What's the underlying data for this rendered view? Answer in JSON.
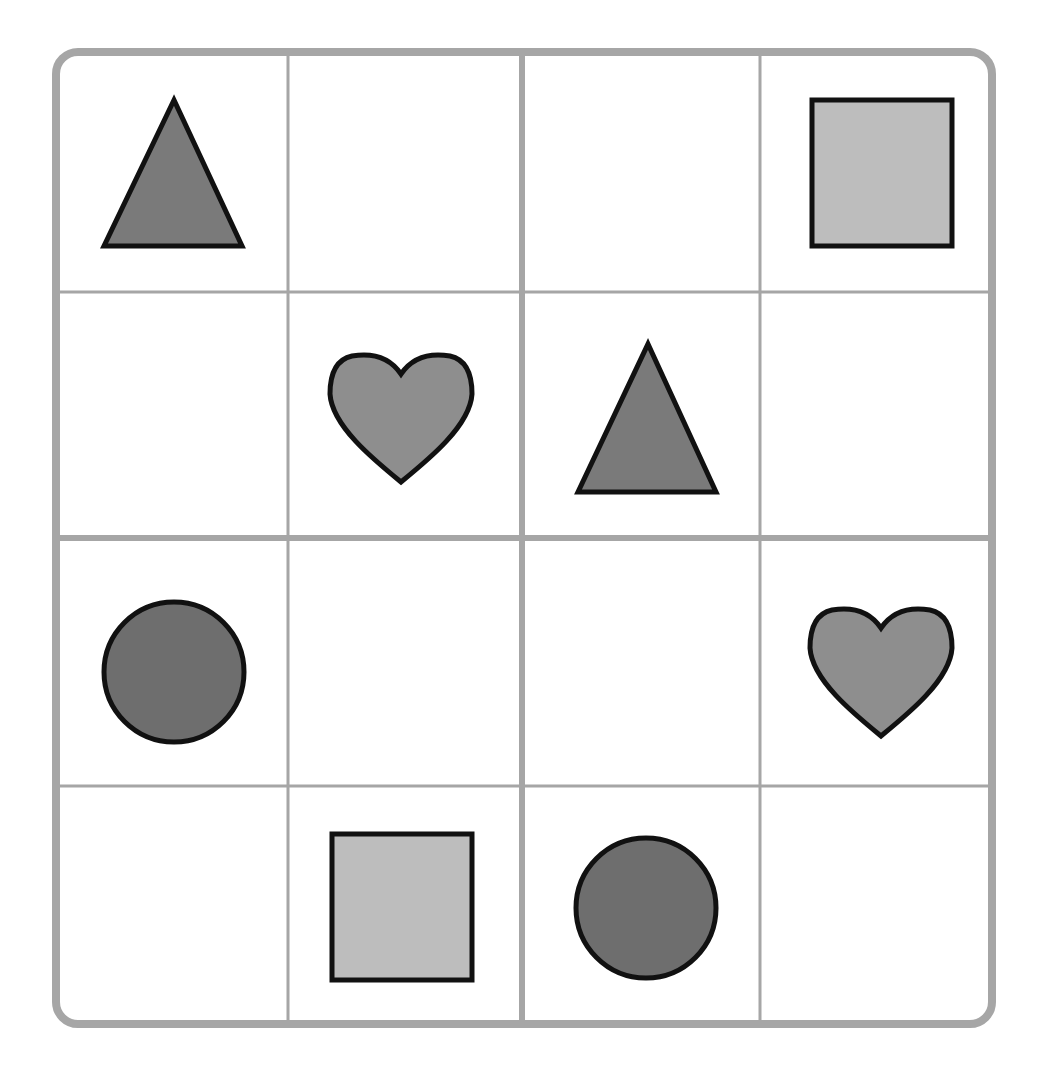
{
  "puzzle": {
    "type": "shape-sudoku-4x4",
    "rows": 4,
    "cols": 4,
    "grid": [
      [
        "triangle",
        "",
        "",
        "square"
      ],
      [
        "",
        "heart",
        "triangle",
        ""
      ],
      [
        "circle",
        "",
        "",
        "heart"
      ],
      [
        "",
        "square",
        "circle",
        ""
      ]
    ]
  },
  "colors": {
    "triangle": "#7a7a7a",
    "square": "#bdbdbd",
    "heart": "#8e8e8e",
    "circle": "#6e6e6e",
    "stroke": "#111111",
    "grid_line": "#a6a6a6"
  }
}
